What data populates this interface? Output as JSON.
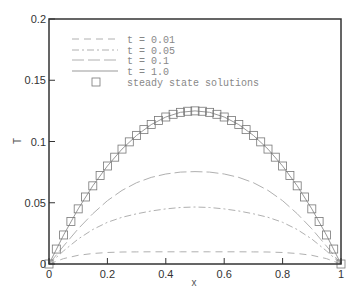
{
  "chart_data": {
    "type": "line",
    "title": "",
    "xlabel": "x",
    "ylabel": "T",
    "xlim": [
      0,
      1
    ],
    "ylim": [
      0,
      0.2
    ],
    "grid": false,
    "legend_position": "upper-left",
    "x_ticks": [
      "0",
      "0.2",
      "0.4",
      "0.6",
      "0.8",
      "1"
    ],
    "y_ticks": [
      "0",
      "0.05",
      "0.1",
      "0.15",
      "0.2"
    ],
    "x": [
      0,
      0.05,
      0.1,
      0.15,
      0.2,
      0.25,
      0.3,
      0.35,
      0.4,
      0.45,
      0.5,
      0.55,
      0.6,
      0.65,
      0.7,
      0.75,
      0.8,
      0.85,
      0.9,
      0.95,
      1
    ],
    "series": [
      {
        "name": "t = 0.01",
        "style": "dashed",
        "values": [
          0,
          0.0044,
          0.0071,
          0.0086,
          0.0094,
          0.0098,
          0.0099,
          0.01,
          0.01,
          0.01,
          0.01,
          0.01,
          0.01,
          0.01,
          0.0099,
          0.0098,
          0.0094,
          0.0086,
          0.0071,
          0.0044,
          0
        ]
      },
      {
        "name": "t = 0.05",
        "style": "dashdot",
        "values": [
          0,
          0.0107,
          0.0204,
          0.0282,
          0.034,
          0.0381,
          0.041,
          0.0433,
          0.045,
          0.0461,
          0.0465,
          0.0461,
          0.045,
          0.0433,
          0.041,
          0.0381,
          0.034,
          0.0282,
          0.0204,
          0.0107,
          0
        ]
      },
      {
        "name": "t = 0.1",
        "style": "longdash",
        "values": [
          0,
          0.0147,
          0.0287,
          0.0411,
          0.0517,
          0.0601,
          0.0664,
          0.0707,
          0.0735,
          0.075,
          0.0754,
          0.075,
          0.0735,
          0.0707,
          0.0664,
          0.0601,
          0.0517,
          0.0411,
          0.0287,
          0.0147,
          0
        ]
      },
      {
        "name": "t = 1.0",
        "style": "solid",
        "values": [
          0,
          0.0237,
          0.045,
          0.0638,
          0.08,
          0.0938,
          0.105,
          0.1138,
          0.12,
          0.1238,
          0.125,
          0.1238,
          0.12,
          0.1138,
          0.105,
          0.0938,
          0.08,
          0.0638,
          0.045,
          0.0237,
          0
        ]
      }
    ],
    "markers": {
      "name": "steady state solutions",
      "shape": "square",
      "x": [
        0,
        0.025,
        0.05,
        0.075,
        0.1,
        0.125,
        0.15,
        0.175,
        0.2,
        0.225,
        0.25,
        0.275,
        0.3,
        0.325,
        0.35,
        0.375,
        0.4,
        0.425,
        0.45,
        0.475,
        0.5,
        0.525,
        0.55,
        0.575,
        0.6,
        0.625,
        0.65,
        0.675,
        0.7,
        0.725,
        0.75,
        0.775,
        0.8,
        0.825,
        0.85,
        0.875,
        0.9,
        0.925,
        0.95,
        0.975,
        1
      ],
      "values": [
        0,
        0.0122,
        0.0237,
        0.0347,
        0.045,
        0.0547,
        0.0638,
        0.0722,
        0.08,
        0.0872,
        0.0938,
        0.0997,
        0.105,
        0.1097,
        0.1138,
        0.1172,
        0.12,
        0.1222,
        0.1238,
        0.1247,
        0.125,
        0.1247,
        0.1238,
        0.1222,
        0.12,
        0.1172,
        0.1138,
        0.1097,
        0.105,
        0.0997,
        0.0938,
        0.0872,
        0.08,
        0.0722,
        0.0638,
        0.0547,
        0.045,
        0.0347,
        0.0237,
        0.0122,
        0
      ]
    },
    "legend": [
      "t = 0.01",
      "t = 0.05",
      "t = 0.1",
      "t = 1.0",
      "steady state solutions"
    ],
    "colors": {
      "frame": "#333333",
      "curves": "#b0b0b0",
      "markers": "#777777",
      "legend_text": "#888888"
    }
  }
}
